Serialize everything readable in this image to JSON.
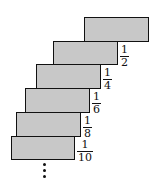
{
  "diagram": {
    "fill_color": "#c8c8c8",
    "stroke_color": "#111111",
    "blocks": [
      {
        "index": 1,
        "left": 84,
        "top": 17,
        "width": 65,
        "height": 24
      },
      {
        "index": 2,
        "left": 53,
        "top": 41,
        "width": 65,
        "height": 24
      },
      {
        "index": 3,
        "left": 36,
        "top": 64,
        "width": 65,
        "height": 25
      },
      {
        "index": 4,
        "left": 25,
        "top": 88,
        "width": 65,
        "height": 25
      },
      {
        "index": 5,
        "left": 16,
        "top": 112,
        "width": 65,
        "height": 25
      },
      {
        "index": 6,
        "left": 11,
        "top": 136,
        "width": 64,
        "height": 24
      }
    ],
    "labels": [
      {
        "num": "1",
        "den": "2",
        "left": 120,
        "top": 46
      },
      {
        "num": "1",
        "den": "4",
        "left": 103,
        "top": 69
      },
      {
        "num": "1",
        "den": "6",
        "left": 92,
        "top": 93
      },
      {
        "num": "1",
        "den": "8",
        "left": 83,
        "top": 117
      },
      {
        "num": "1",
        "den": "10",
        "left": 77,
        "top": 141
      }
    ],
    "continuation": "⋮"
  }
}
